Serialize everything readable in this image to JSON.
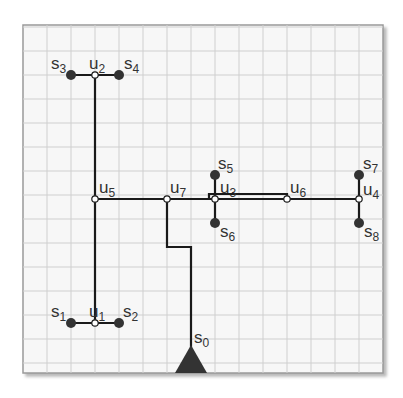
{
  "diagram": {
    "type": "tree-network",
    "grid": {
      "x0": 23,
      "y0": 25,
      "x1": 383,
      "y1": 373,
      "step": 24,
      "color": "#cfcfcf",
      "background": "#f7f7f7",
      "border": "#9a9a9a"
    },
    "colors": {
      "wire": "#1a1a1a",
      "sink": "#333333",
      "steiner_fill": "#ffffff",
      "source": "#333333"
    },
    "source": {
      "id": "s0",
      "label": "s",
      "sub": "0",
      "x": 191,
      "y": 373
    },
    "sinks": [
      {
        "id": "s1",
        "label": "s",
        "sub": "1",
        "x": 71,
        "y": 323
      },
      {
        "id": "s2",
        "label": "s",
        "sub": "2",
        "x": 119,
        "y": 323
      },
      {
        "id": "s3",
        "label": "s",
        "sub": "3",
        "x": 71,
        "y": 75
      },
      {
        "id": "s4",
        "label": "s",
        "sub": "4",
        "x": 119,
        "y": 75
      },
      {
        "id": "s5",
        "label": "s",
        "sub": "5",
        "x": 215,
        "y": 175
      },
      {
        "id": "s6",
        "label": "s",
        "sub": "6",
        "x": 215,
        "y": 223
      },
      {
        "id": "s7",
        "label": "s",
        "sub": "7",
        "x": 359,
        "y": 175
      },
      {
        "id": "s8",
        "label": "s",
        "sub": "8",
        "x": 359,
        "y": 223
      }
    ],
    "steiner_nodes": [
      {
        "id": "u1",
        "label": "u",
        "sub": "1",
        "x": 95,
        "y": 323
      },
      {
        "id": "u2",
        "label": "u",
        "sub": "2",
        "x": 95,
        "y": 75
      },
      {
        "id": "u3",
        "label": "u",
        "sub": "3",
        "x": 215,
        "y": 199
      },
      {
        "id": "u4",
        "label": "u",
        "sub": "4",
        "x": 359,
        "y": 199
      },
      {
        "id": "u5",
        "label": "u",
        "sub": "5",
        "x": 95,
        "y": 199
      },
      {
        "id": "u6",
        "label": "u",
        "sub": "6",
        "x": 287,
        "y": 199
      },
      {
        "id": "u7",
        "label": "u",
        "sub": "7",
        "x": 167,
        "y": 199
      }
    ],
    "wires": [
      "71,75 119,75",
      "95,75 95,323",
      "71,323 119,323",
      "95,199 359,199",
      "167,199 167,247 191,247 191,365",
      "209,199 209,194 287,194 287,199",
      "215,175 215,223",
      "359,175 359,223"
    ]
  }
}
